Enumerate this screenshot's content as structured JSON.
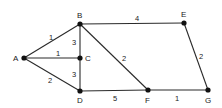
{
  "graph": {
    "type": "weighted-undirected-graph",
    "nodes": [
      {
        "id": "A",
        "label": "A",
        "x": 24,
        "y": 58
      },
      {
        "id": "B",
        "label": "B",
        "x": 80,
        "y": 24
      },
      {
        "id": "C",
        "label": "C",
        "x": 80,
        "y": 58
      },
      {
        "id": "D",
        "label": "D",
        "x": 80,
        "y": 91
      },
      {
        "id": "E",
        "label": "E",
        "x": 184,
        "y": 23
      },
      {
        "id": "F",
        "label": "F",
        "x": 148,
        "y": 90
      },
      {
        "id": "G",
        "label": "G",
        "x": 208,
        "y": 90
      }
    ],
    "edges": [
      {
        "from": "A",
        "to": "B",
        "weight": "1"
      },
      {
        "from": "A",
        "to": "C",
        "weight": "1"
      },
      {
        "from": "A",
        "to": "D",
        "weight": "2"
      },
      {
        "from": "B",
        "to": "C",
        "weight": "3"
      },
      {
        "from": "C",
        "to": "D",
        "weight": "3"
      },
      {
        "from": "B",
        "to": "E",
        "weight": "4"
      },
      {
        "from": "B",
        "to": "F",
        "weight": "2"
      },
      {
        "from": "D",
        "to": "F",
        "weight": "5"
      },
      {
        "from": "E",
        "to": "G",
        "weight": "2"
      },
      {
        "from": "F",
        "to": "G",
        "weight": "1"
      }
    ]
  },
  "labels": {
    "A": "A",
    "B": "B",
    "C": "C",
    "D": "D",
    "E": "E",
    "F": "F",
    "G": "G",
    "w_AB": "1",
    "w_AC": "1",
    "w_AD": "2",
    "w_BC": "3",
    "w_CD": "3",
    "w_BE": "4",
    "w_BF": "2",
    "w_DF": "5",
    "w_EG": "2",
    "w_FG": "1"
  }
}
